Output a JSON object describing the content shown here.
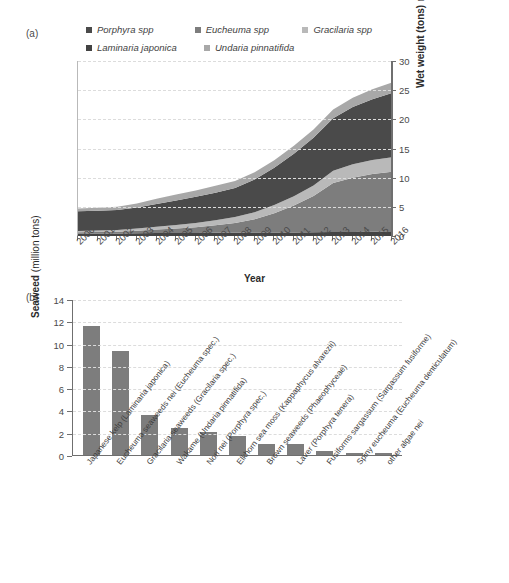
{
  "figure": {
    "panel_a_tag": "(a)",
    "panel_b_tag": "(b)"
  },
  "colors": {
    "porphyra": "#4a4a4a",
    "eucheuma": "#7d7d7d",
    "gracilaria": "#b9b9b9",
    "laminaria": "#434343",
    "undaria": "#a8a8a8",
    "bar": "#7d7d7d",
    "axis": "#6f6f6f",
    "grid": "#dcdcdc"
  },
  "chart_data": [
    {
      "type": "area",
      "panel": "(a)",
      "title": "",
      "xlabel": "Year",
      "ylabel": "Wet weight (tons)",
      "ylabel_suffix": "Millions",
      "ylim": [
        0,
        30
      ],
      "yticks": [
        0,
        5,
        10,
        15,
        20,
        25,
        30
      ],
      "grid": true,
      "legend_position": "top",
      "stacked": true,
      "x": [
        2000,
        2001,
        2002,
        2003,
        2004,
        2005,
        2006,
        2007,
        2008,
        2009,
        2010,
        2011,
        2012,
        2013,
        2014,
        2015,
        2016
      ],
      "categories": [
        "2000",
        "2001",
        "2002",
        "2003",
        "2004",
        "2005",
        "2006",
        "2007",
        "2008",
        "2009",
        "2010",
        "2011",
        "2012",
        "2013",
        "2014",
        "2015",
        "2016"
      ],
      "series": [
        {
          "name": "Laminaria japonica",
          "color": "#434343",
          "values": [
            0.45,
            0.45,
            0.45,
            0.48,
            0.5,
            0.5,
            0.52,
            0.55,
            0.55,
            0.58,
            0.6,
            0.62,
            0.65,
            0.68,
            0.7,
            0.75,
            0.8
          ]
        },
        {
          "name": "Eucheuma spp",
          "color": "#7d7d7d",
          "values": [
            0.2,
            0.25,
            0.3,
            0.4,
            0.6,
            0.8,
            1.0,
            1.3,
            1.7,
            2.3,
            3.3,
            4.6,
            6.2,
            8.4,
            9.3,
            9.9,
            10.2
          ]
        },
        {
          "name": "Gracilaria spp",
          "color": "#b9b9b9",
          "values": [
            0.2,
            0.25,
            0.3,
            0.4,
            0.5,
            0.6,
            0.7,
            0.85,
            1.0,
            1.2,
            1.4,
            1.6,
            1.8,
            2.1,
            2.3,
            2.4,
            2.5
          ]
        },
        {
          "name": "Porphyra spp",
          "color": "#4a4a4a",
          "values": [
            3.4,
            3.4,
            3.4,
            3.6,
            3.9,
            4.2,
            4.5,
            4.7,
            5.0,
            5.6,
            6.4,
            7.3,
            8.2,
            9.0,
            9.8,
            10.4,
            11.0
          ]
        },
        {
          "name": "Undaria pinnatifida",
          "color": "#a8a8a8",
          "values": [
            0.45,
            0.5,
            0.55,
            0.7,
            0.9,
            1.0,
            1.1,
            1.2,
            1.2,
            1.25,
            1.3,
            1.35,
            1.4,
            1.5,
            1.6,
            1.7,
            1.8
          ]
        }
      ],
      "totals": [
        4.7,
        4.85,
        5.0,
        5.58,
        6.4,
        7.1,
        7.82,
        8.6,
        9.45,
        10.93,
        13.0,
        15.47,
        18.25,
        21.68,
        23.7,
        25.15,
        26.3
      ]
    },
    {
      "type": "bar",
      "panel": "(b)",
      "title": "",
      "xlabel": "",
      "ylabel": "Seaweed",
      "ylabel_suffix": "(million tons)",
      "ylim": [
        0,
        14
      ],
      "yticks": [
        0,
        2,
        4,
        6,
        8,
        10,
        12,
        14
      ],
      "grid": true,
      "categories": [
        "Japanese kelp (Laminaria japonica)",
        "Eucheuma seaweeds nei (Eucheuma spec.)",
        "Gracilaria seaweeds (Gracilaria spec.)",
        "Wakame (Undaria pinnatifida)",
        "Nori nei (Porphyra spec.)",
        "Elkhorn sea moss (Kappaphycus alvarezii)",
        "Brown seaweeds (Phaeophyceae)",
        "Laver (Porphyra tenera)",
        "Fusiforms sargassum (Sargassum fusiforme)",
        "Spiny eucheuma (Eucheuma denticulatum)",
        "other algae nei"
      ],
      "short_labels": [
        "Japanese kelp",
        "Eucheuma seaweeds nei",
        "Gracilaria seaweeds",
        "Wakame",
        "Nori nei",
        "Elkhorn sea moss",
        "Brown seaweeds",
        "Laver",
        "Fusiforms sargassum",
        "Spiny eucheuma",
        "other algae nei"
      ],
      "values": [
        11.6,
        9.3,
        3.55,
        2.4,
        2.1,
        1.7,
        1.0,
        1.0,
        0.4,
        0.2,
        0.2
      ]
    }
  ],
  "panel_a": {
    "legend": [
      {
        "label": "Porphyra spp",
        "color": "#4a4a4a"
      },
      {
        "label": "Eucheuma spp",
        "color": "#7d7d7d"
      },
      {
        "label": "Gracilaria spp",
        "color": "#b9b9b9"
      },
      {
        "label": "Laminaria japonica",
        "color": "#434343"
      },
      {
        "label": "Undaria pinnatifida",
        "color": "#a8a8a8"
      }
    ],
    "y_axis_title": "Wet weight (tons)",
    "y_axis_unit": "Millions",
    "x_axis_title": "Year"
  },
  "panel_b": {
    "y_axis_title": "Seaweed",
    "y_axis_unit": "(million tons)"
  }
}
